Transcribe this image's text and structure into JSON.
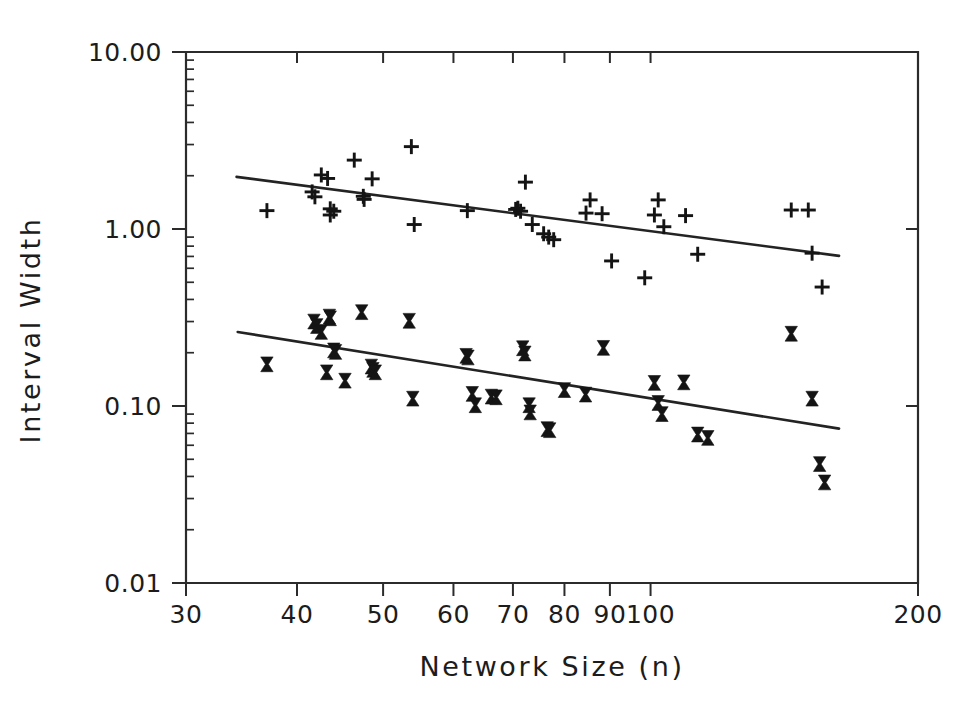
{
  "chart_data": {
    "type": "scatter",
    "title": "",
    "xlabel": "Network Size (n)",
    "ylabel": "Interval Width",
    "xscale": "log",
    "yscale": "log",
    "xlim": [
      30,
      200
    ],
    "ylim": [
      0.01,
      10.0
    ],
    "grid": false,
    "legend": "none",
    "xticks": [
      30,
      40,
      50,
      60,
      70,
      80,
      90,
      100,
      200
    ],
    "xticklabels": [
      "30",
      "40",
      "50",
      "60",
      "70",
      "80",
      "90",
      "100",
      "200"
    ],
    "yticks": [
      0.01,
      0.1,
      1.0,
      10.0
    ],
    "yticklabels": [
      "0.01",
      "0.10",
      "1.00",
      "10.00"
    ],
    "series": [
      {
        "name": "upper-series",
        "marker": "plus",
        "points": [
          [
            37.0,
            1.27
          ],
          [
            41.6,
            1.62
          ],
          [
            41.9,
            1.52
          ],
          [
            42.6,
            2.02
          ],
          [
            43.3,
            1.93
          ],
          [
            43.6,
            1.3
          ],
          [
            43.6,
            1.2
          ],
          [
            44.0,
            1.26
          ],
          [
            46.4,
            2.45
          ],
          [
            47.5,
            1.53
          ],
          [
            47.6,
            1.47
          ],
          [
            48.6,
            1.92
          ],
          [
            53.8,
            2.92
          ],
          [
            54.2,
            1.06
          ],
          [
            62.2,
            1.27
          ],
          [
            70.5,
            1.29
          ],
          [
            70.9,
            1.31
          ],
          [
            71.4,
            1.26
          ],
          [
            72.3,
            1.84
          ],
          [
            73.6,
            1.06
          ],
          [
            75.8,
            0.94
          ],
          [
            76.8,
            0.9
          ],
          [
            77.8,
            0.87
          ],
          [
            84.6,
            1.23
          ],
          [
            85.5,
            1.46
          ],
          [
            88.2,
            1.22
          ],
          [
            90.4,
            0.66
          ],
          [
            98.5,
            0.53
          ],
          [
            101.0,
            1.2
          ],
          [
            102.0,
            1.46
          ],
          [
            103.5,
            1.03
          ],
          [
            109.5,
            1.19
          ],
          [
            113.0,
            0.72
          ],
          [
            144.0,
            1.28
          ],
          [
            150.5,
            1.28
          ],
          [
            152.0,
            0.73
          ],
          [
            156.0,
            0.47
          ]
        ]
      },
      {
        "name": "lower-series",
        "marker": "bowtie",
        "points": [
          [
            37.0,
            0.172
          ],
          [
            41.8,
            0.3
          ],
          [
            42.1,
            0.283
          ],
          [
            42.6,
            0.262
          ],
          [
            43.2,
            0.155
          ],
          [
            43.5,
            0.32
          ],
          [
            43.6,
            0.313
          ],
          [
            44.0,
            0.206
          ],
          [
            44.2,
            0.202
          ],
          [
            45.3,
            0.139
          ],
          [
            47.3,
            0.339
          ],
          [
            48.5,
            0.167
          ],
          [
            48.7,
            0.16
          ],
          [
            49.0,
            0.155
          ],
          [
            53.5,
            0.303
          ],
          [
            54.0,
            0.11
          ],
          [
            62.0,
            0.192
          ],
          [
            62.3,
            0.188
          ],
          [
            63.0,
            0.117
          ],
          [
            63.5,
            0.101
          ],
          [
            66.2,
            0.113
          ],
          [
            67.0,
            0.112
          ],
          [
            71.8,
            0.212
          ],
          [
            72.2,
            0.198
          ],
          [
            73.0,
            0.101
          ],
          [
            73.2,
            0.092
          ],
          [
            76.5,
            0.074
          ],
          [
            77.0,
            0.073
          ],
          [
            80.0,
            0.123
          ],
          [
            84.5,
            0.116
          ],
          [
            88.5,
            0.213
          ],
          [
            101.0,
            0.135
          ],
          [
            102.0,
            0.104
          ],
          [
            103.0,
            0.09
          ],
          [
            109.0,
            0.136
          ],
          [
            113.0,
            0.069
          ],
          [
            116.0,
            0.066
          ],
          [
            144.0,
            0.256
          ],
          [
            152.0,
            0.11
          ],
          [
            155.0,
            0.047
          ],
          [
            157.0,
            0.037
          ]
        ]
      }
    ],
    "fit_lines": [
      {
        "name": "upper-fit-line",
        "series": "upper-series",
        "x_start": 34.2,
        "y_start": 1.97,
        "x_end": 163.0,
        "y_end": 0.705
      },
      {
        "name": "lower-fit-line",
        "series": "lower-series",
        "x_start": 34.3,
        "y_start": 0.262,
        "x_end": 163.0,
        "y_end": 0.0745
      }
    ]
  },
  "axes": {
    "x_title": "Network Size (n)",
    "y_title": "Interval Width",
    "x_labels": [
      "30",
      "40",
      "50",
      "60",
      "70",
      "80",
      "90",
      "100",
      "200"
    ],
    "y_labels": [
      "10.00",
      "1.00",
      "0.10",
      "0.01"
    ]
  }
}
